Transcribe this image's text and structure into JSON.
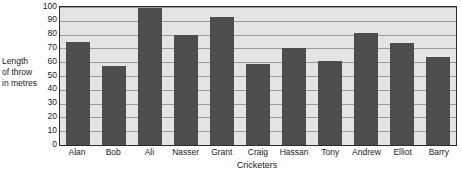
{
  "chart_data": {
    "type": "bar",
    "title": "",
    "subtitle": "",
    "xlabel": "Cricketers",
    "ylabel": "Length of throw in metres",
    "ylabel_lines": [
      "Length",
      "of throw",
      "in metres"
    ],
    "categories": [
      "Alan",
      "Bob",
      "Ali",
      "Nasser",
      "Grant",
      "Craig",
      "Hassan",
      "Tony",
      "Andrew",
      "Elliot",
      "Barry"
    ],
    "values": [
      75,
      57,
      99,
      80,
      93,
      59,
      70,
      61,
      81,
      74,
      64
    ],
    "ylim": [
      0,
      100
    ],
    "ytick_values": [
      0,
      10,
      20,
      30,
      40,
      50,
      60,
      70,
      80,
      90,
      100
    ],
    "ytick_labels": [
      "0",
      "10",
      "20",
      "30",
      "40",
      "50",
      "60",
      "70",
      "80",
      "90",
      "100"
    ],
    "grid": true,
    "grid_axis": "y",
    "legend": false,
    "legend_position": "none",
    "bar_color": "#4d4d4d",
    "plot_background_color": "#e4e4e4",
    "axis_color": "#2b2b2b",
    "gridline_color": "#9a9a9a",
    "text_color": "#1a1a1a",
    "figure_background_color": "#ffffff",
    "annotations": []
  }
}
